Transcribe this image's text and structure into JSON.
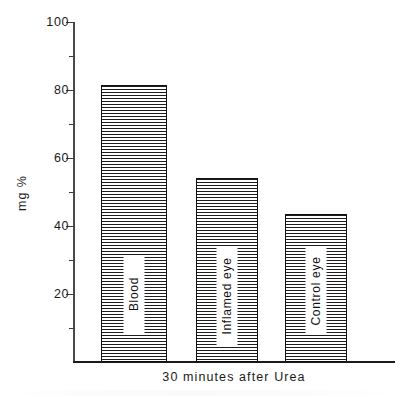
{
  "chart_data": {
    "type": "bar",
    "title": "",
    "subtitle": "",
    "xlabel": "30 minutes after Urea",
    "ylabel": "mg %",
    "ylim": [
      0,
      100
    ],
    "grid": false,
    "legend": "none",
    "categories": [
      "Blood",
      "Inflamed eye",
      "Control eye"
    ],
    "values": [
      81.5,
      54,
      43.5
    ],
    "bar_labels": [
      "Blood",
      "Inflamed eye",
      "Control eye"
    ],
    "y_tick_labels": [
      "100",
      "80",
      "60",
      "40",
      "20"
    ],
    "y_tick_values": [
      100,
      80,
      60,
      40,
      20
    ],
    "y_minor_tick_values": [
      90,
      70,
      50,
      30,
      10
    ],
    "bar_fill": "horizontal-hatch",
    "colors": {
      "bar_outline": "#111111",
      "bar_hatch": "#1d1d1d",
      "axis": "#1a1a1a",
      "text": "#1a1a1a",
      "background": "#ffffff"
    }
  },
  "axis": {
    "y_title": "mg %",
    "x_caption": "30 minutes after Urea"
  },
  "bars": [
    {
      "name": "blood",
      "label": "Blood",
      "value": 81.5
    },
    {
      "name": "inflamed-eye",
      "label": "Inflamed eye",
      "value": 54
    },
    {
      "name": "control-eye",
      "label": "Control eye",
      "value": 43.5
    }
  ],
  "ticks": {
    "major": [
      {
        "label": "100",
        "value": 100
      },
      {
        "label": "80",
        "value": 80
      },
      {
        "label": "60",
        "value": 60
      },
      {
        "label": "40",
        "value": 40
      },
      {
        "label": "20",
        "value": 20
      }
    ],
    "minor": [
      90,
      70,
      50,
      30,
      10
    ]
  }
}
